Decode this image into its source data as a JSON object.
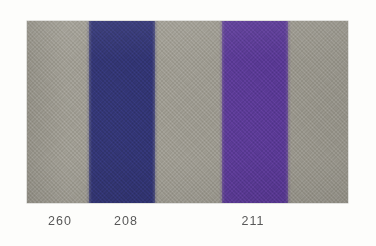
{
  "card": {
    "name": "fabric-colour-swatch-card",
    "background_color": "#fdfdfb",
    "panel": {
      "x": 27,
      "y": 21,
      "width": 321,
      "height": 182,
      "border_color": "#827f78",
      "material": "woven textile"
    }
  },
  "bands": [
    {
      "code": "260",
      "name": "warm-grey",
      "color": "#9c998f",
      "x": 0,
      "width": 62,
      "label_center_x": 33
    },
    {
      "code": "208",
      "name": "navy-blue",
      "color": "#2d3070",
      "x": 62,
      "width": 66,
      "label_center_x": 99
    },
    {
      "code": "260b",
      "name": "warm-grey",
      "color": "#9c998f",
      "x": 128,
      "width": 67,
      "label_center_x": null
    },
    {
      "code": "211",
      "name": "violet-purple",
      "color": "#5b3a96",
      "x": 195,
      "width": 66,
      "label_center_x": 226
    },
    {
      "code": "260c",
      "name": "warm-grey",
      "color": "#9c998f",
      "x": 261,
      "width": 60,
      "label_center_x": null
    }
  ],
  "captions": [
    {
      "text": "260",
      "center_x": 33
    },
    {
      "text": "208",
      "center_x": 99
    },
    {
      "text": "211",
      "center_x": 226
    }
  ],
  "colors": {
    "grey": "#9c998f",
    "navy": "#2d3070",
    "purple": "#5b3a96",
    "caption_text": "#585858",
    "page_background": "#fdfdfb"
  }
}
